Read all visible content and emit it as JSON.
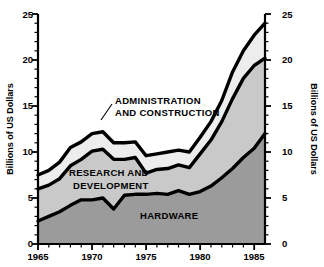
{
  "chart_data": {
    "type": "area",
    "stacked": true,
    "title": "",
    "xlabel": "",
    "ylabel": "Billions of US Dollars",
    "ylabel_right": "Billions of US Dollars",
    "xlim": [
      1965,
      1986
    ],
    "ylim": [
      0,
      25
    ],
    "grid": false,
    "legend_position": "inline-annotations",
    "x_tick_labels": [
      "1965",
      "1970",
      "1975",
      "1980",
      "1985"
    ],
    "x_ticks": [
      1965,
      1970,
      1975,
      1980,
      1985
    ],
    "x_minor_tick_interval": 1,
    "y_tick_labels": [
      "0",
      "5",
      "10",
      "15",
      "20",
      "25"
    ],
    "y_ticks": [
      0,
      5,
      10,
      15,
      20,
      25
    ],
    "y_minor_tick_interval": 1,
    "x": [
      1965,
      1966,
      1967,
      1968,
      1969,
      1970,
      1971,
      1972,
      1973,
      1974,
      1975,
      1976,
      1977,
      1978,
      1979,
      1980,
      1981,
      1982,
      1983,
      1984,
      1985,
      1986
    ],
    "series": [
      {
        "name": "HARDWARE",
        "color": "#9b9b9b",
        "values": [
          2.5,
          3.0,
          3.5,
          4.2,
          4.8,
          4.8,
          5.0,
          3.8,
          5.3,
          5.4,
          5.4,
          5.5,
          5.4,
          5.8,
          5.4,
          5.7,
          6.3,
          7.2,
          8.2,
          9.4,
          10.4,
          12.0
        ]
      },
      {
        "name": "RESEARCH AND DEVELOPMENT",
        "color": "#c9c9c9",
        "values": [
          3.5,
          3.4,
          3.6,
          4.3,
          4.4,
          5.3,
          5.3,
          5.4,
          3.9,
          4.0,
          2.3,
          2.6,
          2.8,
          2.8,
          2.9,
          4.1,
          5.0,
          6.1,
          7.6,
          8.6,
          9.0,
          8.2
        ]
      },
      {
        "name": "ADMINISTRATION AND CONSTRUCTION",
        "color": "#ededed",
        "values": [
          1.5,
          1.6,
          1.8,
          2.0,
          1.9,
          1.9,
          1.9,
          1.8,
          1.8,
          1.7,
          1.9,
          1.7,
          1.8,
          1.6,
          1.7,
          1.8,
          2.0,
          2.3,
          2.9,
          3.0,
          3.3,
          3.8
        ]
      }
    ],
    "cumulative_totals": {
      "hardware_top": [
        2.5,
        3.0,
        3.5,
        4.2,
        4.8,
        4.8,
        5.0,
        3.8,
        5.3,
        5.4,
        5.4,
        5.5,
        5.4,
        5.8,
        5.4,
        5.7,
        6.3,
        7.2,
        8.2,
        9.4,
        10.4,
        12.0
      ],
      "rd_top": [
        6.0,
        6.4,
        7.1,
        8.5,
        9.2,
        10.1,
        10.3,
        9.2,
        9.2,
        9.4,
        7.7,
        8.1,
        8.2,
        8.6,
        8.3,
        9.8,
        11.3,
        13.3,
        15.8,
        18.0,
        19.4,
        20.2
      ],
      "total": [
        7.5,
        8.0,
        8.9,
        10.5,
        11.1,
        12.0,
        12.2,
        11.0,
        11.0,
        11.1,
        9.6,
        9.8,
        10.0,
        10.2,
        10.0,
        11.6,
        13.3,
        15.6,
        18.7,
        21.0,
        22.7,
        24.0
      ]
    },
    "annotations": [
      {
        "text_line_1": "ADMINISTRATION",
        "text_line_2": "AND CONSTRUCTION",
        "target_series": "ADMINISTRATION AND CONSTRUCTION",
        "has_leader_line": true
      },
      {
        "text_line_1": "RESEARCH AND",
        "text_line_2": "DEVELOPMENT",
        "target_series": "RESEARCH AND DEVELOPMENT",
        "has_leader_line": false
      },
      {
        "text_line_1": "HARDWARE",
        "text_line_2": "",
        "target_series": "HARDWARE",
        "has_leader_line": false
      }
    ]
  },
  "labels": {
    "y_axis_left": "Billions of US Dollars",
    "y_axis_right": "Billions of US Dollars",
    "admin_line1": "ADMINISTRATION",
    "admin_line2": "AND CONSTRUCTION",
    "rd_line1": "RESEARCH AND",
    "rd_line2": "DEVELOPMENT",
    "hardware": "HARDWARE",
    "y0": "0",
    "y5": "5",
    "y10": "10",
    "y15": "15",
    "y20": "20",
    "y25": "25",
    "y0r": "0",
    "y5r": "5",
    "y10r": "10",
    "y15r": "15",
    "y20r": "20",
    "y25r": "25",
    "x1965": "1965",
    "x1970": "1970",
    "x1975": "1975",
    "x1980": "1980",
    "x1985": "1985"
  },
  "colors": {
    "hardware": "#9b9b9b",
    "research": "#c9c9c9",
    "administration": "#ededed",
    "outline": "#000000",
    "background": "#ffffff"
  }
}
